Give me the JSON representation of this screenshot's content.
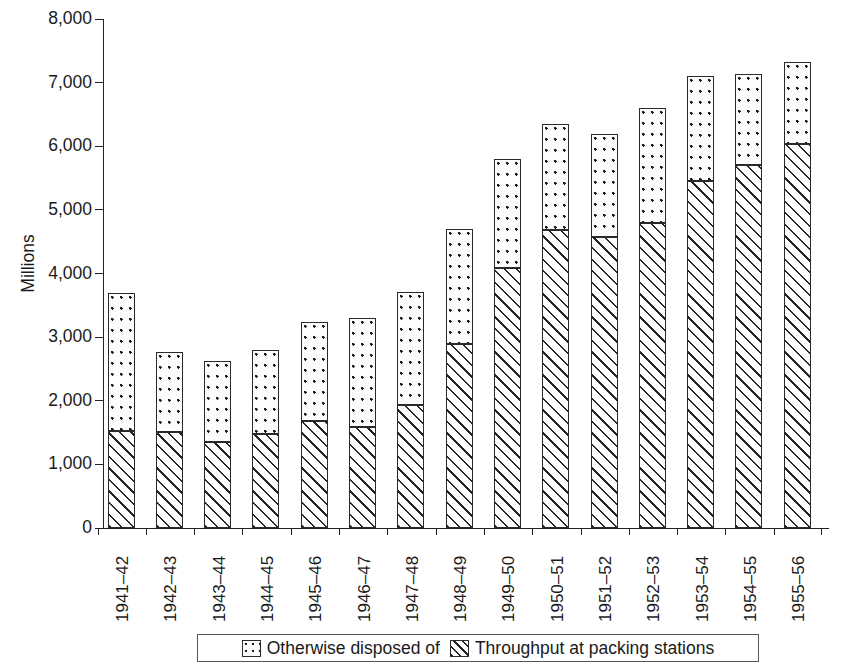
{
  "chart_data": {
    "type": "bar",
    "subtype": "stacked-vertical",
    "title": "",
    "subtitle": "",
    "xlabel": "",
    "ylabel": "Millions",
    "ylim": [
      0,
      8000
    ],
    "ytick_values": [
      0,
      1000,
      2000,
      3000,
      4000,
      5000,
      6000,
      7000,
      8000
    ],
    "ytick_labels": [
      "0",
      "1,000",
      "2,000",
      "3,000",
      "4,000",
      "5,000",
      "6,000",
      "7,000",
      "8,000"
    ],
    "grid": false,
    "legend_position": "bottom",
    "categories": [
      "1941–42",
      "1942–43",
      "1943–44",
      "1944–45",
      "1945–46",
      "1946–47",
      "1947–48",
      "1948–49",
      "1949–50",
      "1950–51",
      "1951–52",
      "1952–53",
      "1953–54",
      "1954–55",
      "1955–56"
    ],
    "series": [
      {
        "name": "Throughput at packing stations",
        "fill": "diagonal-hatch",
        "stack_order": 0,
        "values": [
          1520,
          1510,
          1350,
          1480,
          1680,
          1590,
          1930,
          2890,
          4090,
          4690,
          4580,
          4800,
          5450,
          5700,
          6040
        ]
      },
      {
        "name": "Otherwise disposed of",
        "fill": "dotted",
        "stack_order": 1,
        "values": [
          2180,
          1260,
          1280,
          1320,
          1560,
          1710,
          1780,
          1810,
          1710,
          1660,
          1620,
          1800,
          1650,
          1440,
          1290
        ]
      }
    ],
    "totals": [
      3700,
      2770,
      2630,
      2800,
      3240,
      3300,
      3710,
      4700,
      5800,
      6350,
      6200,
      6600,
      7100,
      7140,
      7330
    ]
  },
  "axis": {
    "y_title": "Millions"
  },
  "legend": {
    "items": [
      {
        "label": "Otherwise disposed of",
        "icon": "dotted-swatch-icon"
      },
      {
        "label": "Throughput at packing stations",
        "icon": "hatch-swatch-icon"
      }
    ]
  }
}
